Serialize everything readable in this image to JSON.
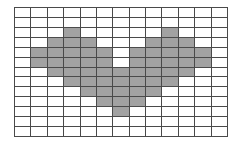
{
  "figure": {
    "grid": {
      "columns": 13,
      "rows": 13,
      "cell_width_px": 16.46,
      "cell_height_px": 10.0,
      "origin_x_px": 14,
      "origin_y_px": 7,
      "width_px": 214,
      "height_px": 130
    },
    "colors": {
      "background": "#ffffff",
      "gridline": "#4a4a4a",
      "fill": "#a2a2a2"
    },
    "filled_cells_by_row": [
      [],
      [],
      [
        3,
        9
      ],
      [
        2,
        3,
        4,
        8,
        9,
        10
      ],
      [
        1,
        2,
        3,
        4,
        5,
        7,
        8,
        9,
        10,
        11
      ],
      [
        1,
        2,
        3,
        4,
        5,
        7,
        8,
        9,
        10,
        11
      ],
      [
        2,
        3,
        4,
        5,
        6,
        7,
        8,
        9,
        10
      ],
      [
        3,
        4,
        5,
        6,
        7,
        8,
        9
      ],
      [
        4,
        5,
        6,
        7,
        8
      ],
      [
        5,
        6,
        7
      ],
      [
        6
      ],
      [],
      []
    ],
    "filled_cell_count": 53
  }
}
